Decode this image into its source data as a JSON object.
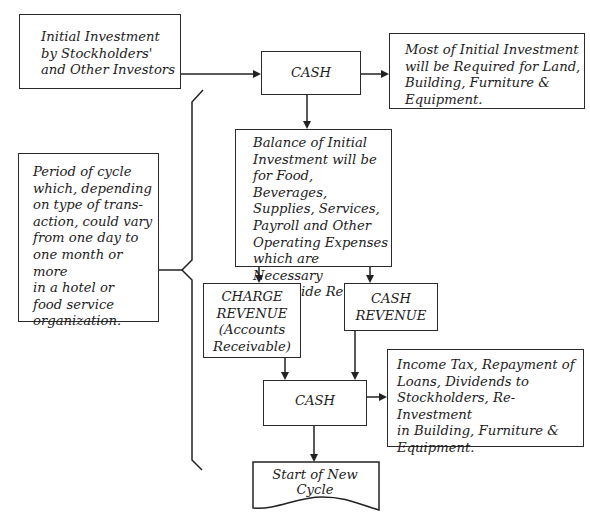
{
  "diagram": {
    "type": "flowchart",
    "topic": "Cash flow cycle in a hotel or food service organization",
    "nodes": {
      "initial_investment": {
        "text": "Initial Investment\nby Stockholders'\nand Other Investors"
      },
      "cash_top": {
        "text": "CASH"
      },
      "most_of_investment": {
        "text": "Most of Initial Investment\nwill be Required for Land,\nBuilding, Furniture &\nEquipment."
      },
      "balance_of_investment": {
        "text": "Balance of Initial\nInvestment will be\nfor Food, Beverages,\nSupplies, Services,\nPayroll and Other\nOperating Expenses\nwhich are Necessary\nto Provide Revenue."
      },
      "period_of_cycle": {
        "text": "Period of cycle\nwhich, depending\non type of trans-\naction, could vary\nfrom one day to\none month or more\nin a hotel or\nfood service\norganization."
      },
      "charge_revenue": {
        "text": "CHARGE\nREVENUE\n(Accounts\nReceivable)"
      },
      "cash_revenue": {
        "text": "CASH\nREVENUE"
      },
      "cash_bottom": {
        "text": "CASH"
      },
      "income_tax": {
        "text": "Income Tax, Repayment of\nLoans, Dividends to\nStockholders, Re-Investment\nin Building, Furniture &\nEquipment."
      },
      "start_new_cycle": {
        "text": "Start of New Cycle"
      }
    },
    "edges": [
      {
        "from": "initial_investment",
        "to": "cash_top"
      },
      {
        "from": "cash_top",
        "to": "most_of_investment"
      },
      {
        "from": "cash_top",
        "to": "balance_of_investment"
      },
      {
        "from": "balance_of_investment",
        "to": "charge_revenue"
      },
      {
        "from": "balance_of_investment",
        "to": "cash_revenue"
      },
      {
        "from": "charge_revenue",
        "to": "cash_bottom"
      },
      {
        "from": "cash_revenue",
        "to": "cash_bottom"
      },
      {
        "from": "cash_bottom",
        "to": "income_tax"
      },
      {
        "from": "cash_bottom",
        "to": "start_new_cycle"
      }
    ],
    "bracket": {
      "label_node": "period_of_cycle",
      "spans": "cash_top to start_new_cycle"
    }
  }
}
